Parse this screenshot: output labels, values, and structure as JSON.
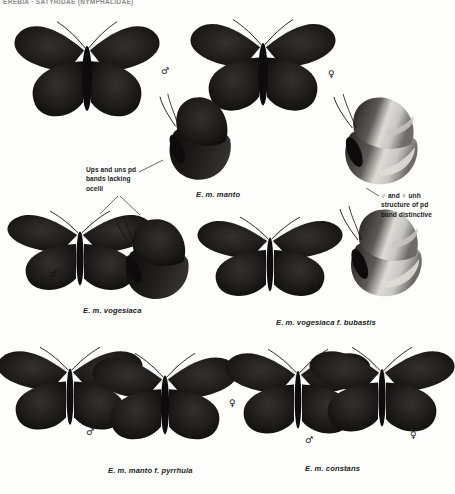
{
  "header": {
    "title": "EREBIA · SATYRIDAE (NYMPHALIDAE)"
  },
  "captions": [
    {
      "id": "manto",
      "text": "E. m. manto",
      "x": 196,
      "y": 190
    },
    {
      "id": "vogesiaca",
      "text": "E. m. vogesiaca",
      "x": 83,
      "y": 306
    },
    {
      "id": "bubastis",
      "text": "E. m. vogesiaca f. bubastis",
      "x": 276,
      "y": 318
    },
    {
      "id": "pyrrhula",
      "text": "E. m. manto f. pyrrhula",
      "x": 108,
      "y": 466
    },
    {
      "id": "constans",
      "text": "E. m. constans",
      "x": 305,
      "y": 464
    }
  ],
  "notes": [
    {
      "id": "ocelli-note",
      "text": "Ups and uns pd\nbands lacking\nocelli",
      "x": 86,
      "y": 165
    },
    {
      "id": "pd-band-note",
      "text": "♂ and ♀ unh\nstructure of pd\nband distinctive",
      "x": 381,
      "y": 191
    }
  ],
  "sex_marks": [
    {
      "id": "manto-male",
      "symbol": "♂",
      "x": 161,
      "y": 67
    },
    {
      "id": "manto-female",
      "symbol": "♀",
      "x": 328,
      "y": 70
    },
    {
      "id": "vogesiaca-male",
      "symbol": "♂",
      "x": 49,
      "y": 270
    },
    {
      "id": "bubastis-female",
      "symbol": "♀",
      "x": 308,
      "y": 282
    },
    {
      "id": "pyrrhula-male",
      "symbol": "♂",
      "x": 86,
      "y": 428
    },
    {
      "id": "pyrrhula-female",
      "symbol": "♀",
      "x": 229,
      "y": 399
    },
    {
      "id": "constans-male",
      "symbol": "♂",
      "x": 305,
      "y": 436
    },
    {
      "id": "constans-female",
      "symbol": "♀",
      "x": 410,
      "y": 431
    }
  ],
  "colors": {
    "page_background": "#fdfdfc",
    "wing_dark": "#201d1c",
    "wing_darkest": "#0d0b0b",
    "wing_mid": "#34302e",
    "underside_grey": "#7d7a78",
    "underside_pale": "#c8c6c2",
    "band_pale": "#dedbd6",
    "text": "#1d1d1d"
  },
  "specimens": [
    {
      "id": "manto-male-ups",
      "view": "spread-upperside",
      "x": 18,
      "y": 18,
      "w": 138,
      "h": 108,
      "tone": "dark"
    },
    {
      "id": "manto-female-ups",
      "view": "spread-upperside",
      "x": 196,
      "y": 16,
      "w": 134,
      "h": 104,
      "tone": "dark"
    },
    {
      "id": "manto-male-uns",
      "view": "folded-underside",
      "x": 160,
      "y": 92,
      "w": 78,
      "h": 95,
      "tone": "dark"
    },
    {
      "id": "manto-female-uns",
      "view": "folded-underside",
      "x": 334,
      "y": 92,
      "w": 92,
      "h": 100,
      "tone": "banded"
    },
    {
      "id": "vogesiaca-male-ups",
      "view": "spread-upperside",
      "x": 28,
      "y": 208,
      "w": 104,
      "h": 90,
      "tone": "dark"
    },
    {
      "id": "vogesiaca-male-uns",
      "view": "folded-underside",
      "x": 116,
      "y": 214,
      "w": 80,
      "h": 92,
      "tone": "dark"
    },
    {
      "id": "bubastis-female-ups",
      "view": "spread-upperside",
      "x": 222,
      "y": 214,
      "w": 96,
      "h": 90,
      "tone": "dark"
    },
    {
      "id": "bubastis-female-uns",
      "view": "folded-underside",
      "x": 340,
      "y": 204,
      "w": 90,
      "h": 100,
      "tone": "banded"
    },
    {
      "id": "pyrrhula-male-ups",
      "view": "spread-upperside",
      "x": 20,
      "y": 344,
      "w": 100,
      "h": 94,
      "tone": "dark"
    },
    {
      "id": "pyrrhula-female-ups",
      "view": "spread-upperside",
      "x": 106,
      "y": 350,
      "w": 118,
      "h": 98,
      "tone": "dark"
    },
    {
      "id": "constans-male-ups",
      "view": "spread-upperside",
      "x": 250,
      "y": 346,
      "w": 96,
      "h": 96,
      "tone": "dark"
    },
    {
      "id": "constans-female-ups",
      "view": "spread-upperside",
      "x": 330,
      "y": 344,
      "w": 104,
      "h": 96,
      "tone": "dark"
    }
  ],
  "leaders": [
    {
      "id": "ocelli-leader-right",
      "x1": 139,
      "y1": 172,
      "x2": 163,
      "y2": 160
    },
    {
      "id": "ocelli-leader-down",
      "x1": 120,
      "y1": 196,
      "x2": 140,
      "y2": 215
    },
    {
      "id": "ocelli-leader-down2",
      "x1": 118,
      "y1": 196,
      "x2": 100,
      "y2": 214
    },
    {
      "id": "pdband-leader",
      "x1": 379,
      "y1": 196,
      "x2": 366,
      "y2": 188
    }
  ]
}
